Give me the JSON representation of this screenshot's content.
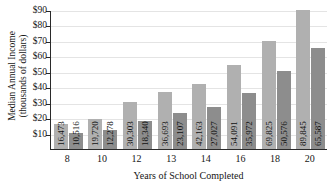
{
  "chart_data": {
    "type": "bar",
    "title": "",
    "xlabel": "Years of School Completed",
    "ylabel": "Median Annual Income (thousands of dollars)",
    "ylabel_line1": "Median Annual Income",
    "ylabel_line2": "(thousands of dollars)",
    "categories": [
      "8",
      "10",
      "12",
      "13",
      "14",
      "16",
      "18",
      "20"
    ],
    "series": [
      {
        "name": "series-1",
        "color": "#b0b0b0",
        "values": [
          16473,
          19720,
          30303,
          36693,
          42163,
          54091,
          69825,
          89845
        ],
        "labels": [
          "16,473",
          "19,720",
          "30,303",
          "36,693",
          "42,163",
          "54,091",
          "69,825",
          "89,845"
        ]
      },
      {
        "name": "series-2",
        "color": "#8d8d8d",
        "values": [
          10516,
          12278,
          18340,
          23107,
          27027,
          35972,
          50576,
          65587
        ],
        "labels": [
          "10,516",
          "12,278",
          "18,340",
          "23,107",
          "27,027",
          "35,972",
          "50,576",
          "65,587"
        ]
      }
    ],
    "ytick_values": [
      10,
      20,
      30,
      40,
      50,
      60,
      70,
      80,
      90
    ],
    "ytick_labels": [
      "$10",
      "$20",
      "$30",
      "$40",
      "$50",
      "$60",
      "$70",
      "$80",
      "$90"
    ],
    "ylim": [
      0,
      90
    ],
    "y_unit": "thousands of dollars",
    "grid": true,
    "legend": "none"
  }
}
